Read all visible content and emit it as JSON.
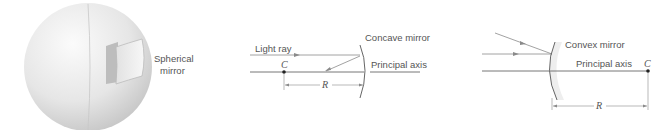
{
  "panels": [
    {
      "id": "sphere",
      "label_line1": "Spherical",
      "label_line2": "mirror"
    },
    {
      "id": "concave",
      "mirror_label": "Concave mirror",
      "ray_label": "Light ray",
      "axis_label": "Principal axis",
      "center_label": "C",
      "radius_label": "R"
    },
    {
      "id": "convex",
      "mirror_label": "Convex mirror",
      "axis_label": "Principal axis",
      "center_label": "C",
      "radius_label": "R"
    }
  ],
  "colors": {
    "line": "#8a8a8a",
    "axis": "#666666",
    "text": "#555555",
    "sphere_light": "#f4f4f4",
    "sphere_dark": "#c9c9c9"
  }
}
